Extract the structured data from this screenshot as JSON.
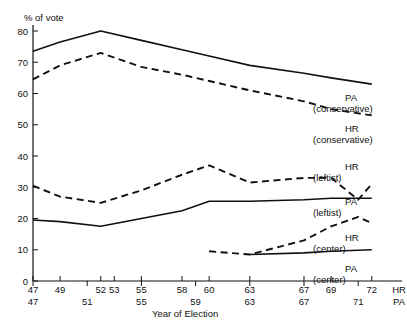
{
  "chart_data": {
    "type": "line",
    "title": "",
    "xlabel": "Year of Election",
    "ylabel": "% of vote",
    "ylim": [
      0,
      80
    ],
    "yticks": [
      0,
      10,
      20,
      30,
      40,
      50,
      60,
      70,
      80
    ],
    "grid": false,
    "legend_position": "right-inline",
    "xlabel_rows": [
      {
        "row_name": "HR",
        "corner_label": "HR",
        "ticks": [
          {
            "label": "47",
            "year": 47
          },
          {
            "label": "49",
            "year": 49
          },
          {
            "label": "52",
            "year": 52
          },
          {
            "label": "53",
            "year": 53
          },
          {
            "label": "55",
            "year": 55
          },
          {
            "label": "58",
            "year": 58
          },
          {
            "label": "60",
            "year": 60
          },
          {
            "label": "63",
            "year": 63
          },
          {
            "label": "67",
            "year": 67
          },
          {
            "label": "69",
            "year": 69
          },
          {
            "label": "72",
            "year": 72
          }
        ]
      },
      {
        "row_name": "PA",
        "corner_label": "PA",
        "ticks": [
          {
            "label": "47",
            "year": 47
          },
          {
            "label": "51",
            "year": 51
          },
          {
            "label": "55",
            "year": 55
          },
          {
            "label": "59",
            "year": 59
          },
          {
            "label": "63",
            "year": 63
          },
          {
            "label": "67",
            "year": 67
          },
          {
            "label": "71",
            "year": 71
          }
        ]
      }
    ],
    "series": [
      {
        "name": "PA (conservative)",
        "label_line1": "PA",
        "label_line2": "(conservative)",
        "style": "solid",
        "x": [
          47,
          49,
          52,
          55,
          58,
          60,
          63,
          67,
          69,
          72
        ],
        "values": [
          73.5,
          76.5,
          80.0,
          77.0,
          74.0,
          72.0,
          69.0,
          66.5,
          65.0,
          63.0
        ]
      },
      {
        "name": "HR (conservative)",
        "label_line1": "HR",
        "label_line2": "(conservative)",
        "style": "dashed",
        "x": [
          47,
          49,
          52,
          55,
          58,
          60,
          63,
          67,
          69,
          72
        ],
        "values": [
          64.5,
          69.0,
          73.0,
          68.5,
          66.0,
          64.0,
          61.0,
          57.5,
          55.0,
          53.0
        ]
      },
      {
        "name": "HR (leftist)",
        "label_line1": "HR",
        "label_line2": "(leftist)",
        "style": "dashed",
        "x": [
          47,
          49,
          52,
          55,
          58,
          60,
          63,
          67,
          69,
          71,
          72
        ],
        "values": [
          30.5,
          27.0,
          25.0,
          29.0,
          34.0,
          37.0,
          31.5,
          33.0,
          33.0,
          26.0,
          31.0
        ]
      },
      {
        "name": "PA (leftist)",
        "label_line1": "PA",
        "label_line2": "(leftist)",
        "style": "solid",
        "x": [
          47,
          49,
          52,
          55,
          58,
          60,
          63,
          67,
          69,
          72
        ],
        "values": [
          19.5,
          19.0,
          17.5,
          20.0,
          22.5,
          25.5,
          25.5,
          26.0,
          26.5,
          26.5
        ]
      },
      {
        "name": "HR (center)",
        "label_line1": "HR",
        "label_line2": "(center)",
        "style": "dashed",
        "x": [
          60,
          63,
          67,
          69,
          71,
          72
        ],
        "values": [
          9.5,
          8.5,
          13.0,
          17.5,
          20.5,
          18.5
        ]
      },
      {
        "name": "PA (center)",
        "label_line1": "PA",
        "label_line2": "(center)",
        "style": "solid",
        "x": [
          63,
          67,
          69,
          72
        ],
        "values": [
          8.5,
          9.0,
          9.5,
          10.0
        ]
      }
    ]
  }
}
